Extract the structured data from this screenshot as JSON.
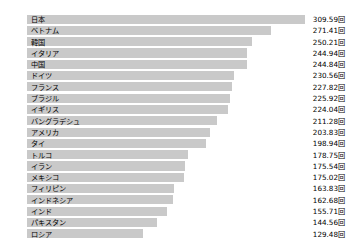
{
  "chart_data": {
    "type": "bar",
    "orientation": "horizontal",
    "title": "",
    "xlabel": "",
    "ylabel": "",
    "unit": "回",
    "grid": false,
    "legend": null,
    "xlim": [
      0,
      340
    ],
    "categories": [
      "日本",
      "ベトナム",
      "韓国",
      "イタリア",
      "中国",
      "ドイツ",
      "フランス",
      "ブラジル",
      "イギリス",
      "バングラデシュ",
      "アメリカ",
      "タイ",
      "トルコ",
      "イラン",
      "メキシコ",
      "フィリピン",
      "インドネシア",
      "インド",
      "パキスタン",
      "ロシア"
    ],
    "values": [
      309.59,
      271.41,
      250.21,
      244.94,
      244.84,
      230.56,
      227.82,
      225.92,
      224.04,
      211.28,
      203.83,
      198.94,
      178.75,
      175.54,
      175.02,
      163.83,
      162.68,
      155.71,
      144.56,
      129.48
    ],
    "value_labels": [
      "309.59回",
      "271.41回",
      "250.21回",
      "244.94回",
      "244.84回",
      "230.56回",
      "227.82回",
      "225.92回",
      "224.04回",
      "211.28回",
      "203.83回",
      "198.94回",
      "178.75回",
      "175.54回",
      "175.02回",
      "163.83回",
      "162.68回",
      "155.71回",
      "144.56回",
      "129.48回"
    ],
    "bar_color": "#c9c9c9",
    "background_color": "#ffffff",
    "text_color": "#000000"
  }
}
